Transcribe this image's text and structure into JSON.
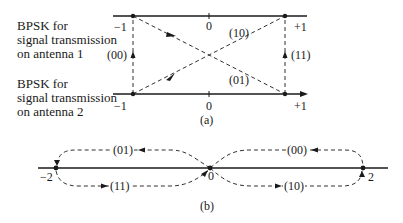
{
  "part_a": {
    "antenna1_label": [
      "BPSK for",
      "signal transmission",
      "on antenna 1"
    ],
    "antenna2_label": [
      "BPSK for",
      "signal transmission",
      "on antenna 2"
    ],
    "top_axis_ticks": {
      "minus": "−1",
      "zero": "0",
      "plus": "+1"
    },
    "bottom_axis_ticks": {
      "minus": "−1",
      "zero": "0",
      "plus": "+1"
    },
    "transitions": {
      "left_vertical": "(00)",
      "right_vertical": "(11)",
      "upper_diagonal": "(10)",
      "lower_diagonal": "(01)"
    },
    "caption": "(a)"
  },
  "part_b": {
    "points": {
      "left": "−2",
      "center": "0",
      "right": "2"
    },
    "loops": {
      "upper_left": "(01)",
      "lower_left": "(11)",
      "upper_right": "(00)",
      "lower_right": "(10)"
    },
    "caption": "(b)"
  },
  "colors": {
    "ink": "#1a1a1a",
    "background": "#ffffff"
  }
}
